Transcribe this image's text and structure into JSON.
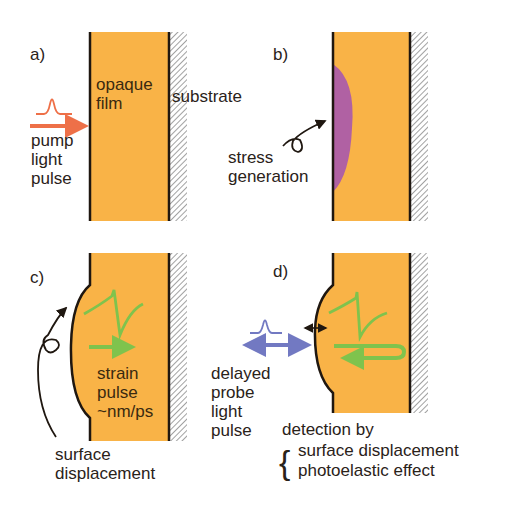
{
  "colors": {
    "film": "#f9b347",
    "pump": "#ee7048",
    "stress": "#b061a3",
    "strain": "#7fc34d",
    "probe": "#7279c2",
    "outline": "#1f1710",
    "hatch": "#9a9a9a"
  },
  "panels": {
    "a": {
      "label": "a)",
      "film_label": "opaque\nfilm",
      "substrate_label": "substrate",
      "pump_label": "pump\nlight\npulse"
    },
    "b": {
      "label": "b)",
      "stress_label": "stress\ngeneration"
    },
    "c": {
      "label": "c)",
      "strain_label": "strain\npulse\n~nm/ps",
      "displacement_label": "surface\ndisplacement"
    },
    "d": {
      "label": "d)",
      "probe_label": "delayed\nprobe\nlight\npulse",
      "detection_title": "detection by",
      "detection_items": [
        "surface displacement",
        "photoelastic effect"
      ],
      "brace": "{"
    }
  }
}
